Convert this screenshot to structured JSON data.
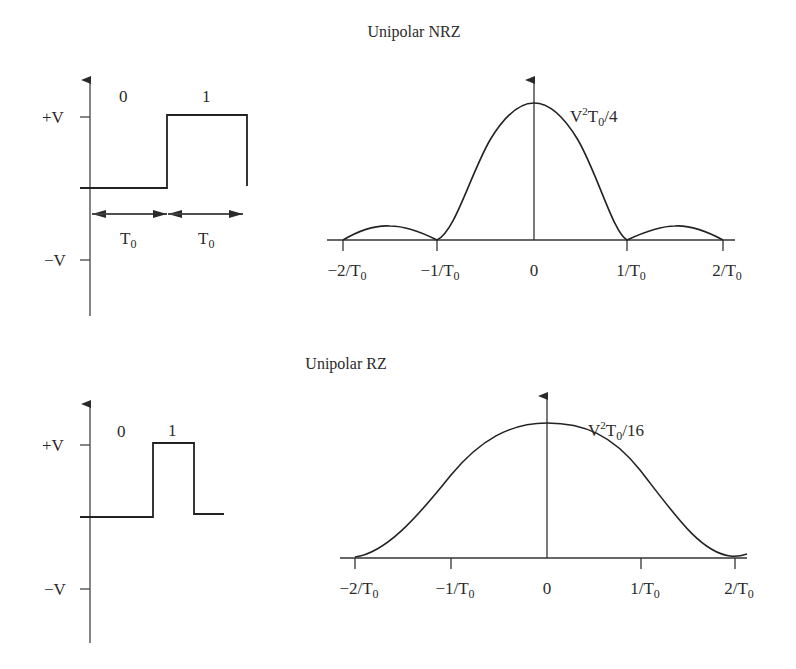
{
  "panels": [
    {
      "title": "Unipolar NRZ",
      "waveform": {
        "y_ticks": [
          "+V",
          "−V"
        ],
        "bit_labels": [
          "0",
          "1"
        ],
        "duration_labels": [
          "T",
          "T"
        ],
        "duration_sub": "0"
      },
      "spectrum": {
        "peak_label_pre": "V",
        "peak_label_sup": "2",
        "peak_label_mid": "T",
        "peak_label_sub": "0",
        "peak_label_post": "/4",
        "x_ticks": [
          {
            "pre": "−2/T",
            "sub": "0"
          },
          {
            "pre": "−1/T",
            "sub": "0"
          },
          {
            "pre": "0",
            "sub": ""
          },
          {
            "pre": "1/T",
            "sub": "0"
          },
          {
            "pre": "2/T",
            "sub": "0"
          }
        ]
      }
    },
    {
      "title": "Unipolar RZ",
      "waveform": {
        "y_ticks": [
          "+V",
          "−V"
        ],
        "bit_labels": [
          "0",
          "1"
        ]
      },
      "spectrum": {
        "peak_label_pre": "V",
        "peak_label_sup": "2",
        "peak_label_mid": "T",
        "peak_label_sub": "0",
        "peak_label_post": "/16",
        "x_ticks": [
          {
            "pre": "−2/T",
            "sub": "0"
          },
          {
            "pre": "−1/T",
            "sub": "0"
          },
          {
            "pre": "0",
            "sub": ""
          },
          {
            "pre": "1/T",
            "sub": "0"
          },
          {
            "pre": "2/T",
            "sub": "0"
          }
        ]
      }
    }
  ],
  "colors": {
    "line": "#2a2a2a",
    "axis": "#444444"
  }
}
